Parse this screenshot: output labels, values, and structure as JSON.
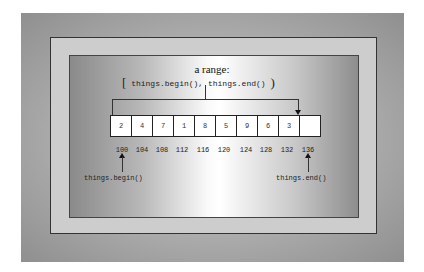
{
  "diagram": {
    "title": "a range:",
    "range_expression": {
      "open_bracket": "[",
      "text": "things.begin(), things.end()",
      "close_bracket": ")"
    },
    "cells": [
      "2",
      "4",
      "7",
      "1",
      "8",
      "5",
      "9",
      "6",
      "3",
      ""
    ],
    "addresses": [
      "100",
      "104",
      "108",
      "112",
      "116",
      "120",
      "124",
      "128",
      "132",
      "136"
    ],
    "begin_label": "things.begin()",
    "end_label": "things.end()"
  }
}
